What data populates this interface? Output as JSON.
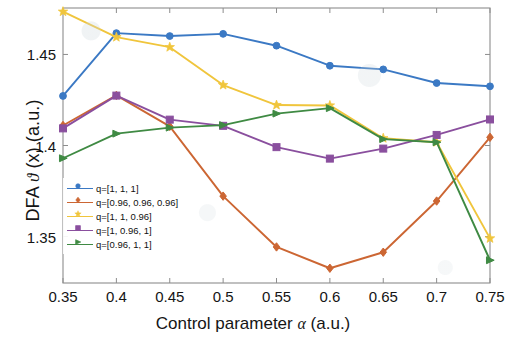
{
  "chart_data": {
    "type": "line",
    "title": "",
    "xlabel": "Control parameter α (a.u.)",
    "ylabel": "DFA ϑ (x) (a.u.)",
    "xlabel_prefix": "Control parameter ",
    "xlabel_symbol": "α",
    "xlabel_suffix": " (a.u.)",
    "ylabel_prefix": "DFA ",
    "ylabel_symbol": "ϑ",
    "ylabel_suffix": " (x) (a.u.)",
    "x": [
      0.35,
      0.4,
      0.45,
      0.5,
      0.55,
      0.6,
      0.65,
      0.7,
      0.75
    ],
    "xticks": [
      "0.35",
      "0.4",
      "0.45",
      "0.5",
      "0.55",
      "0.6",
      "0.65",
      "0.7",
      "0.75"
    ],
    "yticks": [
      "1.35",
      "1.4",
      "1.45"
    ],
    "ytickvals": [
      1.35,
      1.4,
      1.45
    ],
    "xlim": [
      0.35,
      0.75
    ],
    "ylim": [
      1.3245,
      1.4755
    ],
    "grid": false,
    "legend_position": "lower-left-inside",
    "series": [
      {
        "name": "q=[1, 1, 1]",
        "color": "#3b79c4",
        "marker": "circle",
        "values": [
          1.4272,
          1.4617,
          1.4601,
          1.4613,
          1.4548,
          1.4438,
          1.4418,
          1.4343,
          1.4325
        ]
      },
      {
        "name": "q=[0.96, 0.96, 0.96]",
        "color": "#cc6633",
        "marker": "diamond",
        "values": [
          1.411,
          1.4275,
          1.4105,
          1.3722,
          1.3443,
          1.3326,
          1.3414,
          1.3695,
          1.4045
        ]
      },
      {
        "name": "q=[1, 1, 0.96]",
        "color": "#f0c53c",
        "marker": "star",
        "values": [
          1.4735,
          1.4595,
          1.454,
          1.4332,
          1.4222,
          1.422,
          1.404,
          1.4018,
          1.349
        ]
      },
      {
        "name": "q=[1, 0.96, 1]",
        "color": "#8a4f9e",
        "marker": "square",
        "values": [
          1.4094,
          1.4274,
          1.4142,
          1.4108,
          1.3991,
          1.3928,
          1.3983,
          1.4058,
          1.4143
        ]
      },
      {
        "name": "q=[0.96, 1, 1]",
        "color": "#3f8a43",
        "marker": "triangle",
        "values": [
          1.393,
          1.4065,
          1.4098,
          1.4112,
          1.4175,
          1.4205,
          1.4035,
          1.4018,
          1.337
        ]
      }
    ]
  },
  "legend": {
    "items": [
      {
        "label": "q=[1, 1, 1]"
      },
      {
        "label": "q=[0.96, 0.96, 0.96]"
      },
      {
        "label": "q=[1, 1, 0.96]"
      },
      {
        "label": "q=[1, 0.96, 1]"
      },
      {
        "label": "q=[0.96, 1, 1]"
      }
    ]
  },
  "axes": {
    "frame_color": "#8d8d8d",
    "text_color": "#151515"
  }
}
